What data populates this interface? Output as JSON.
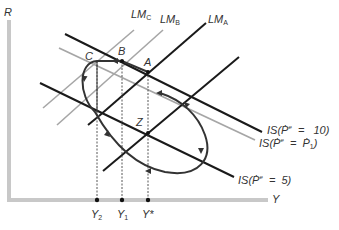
{
  "diagram": {
    "type": "IS-LM dynamic adjustment diagram",
    "axes": {
      "y_label": "R",
      "x_label": "Y",
      "x_ticks": [
        "Y2",
        "Y1",
        "Y*"
      ]
    },
    "curves": {
      "lm_a": "LM_A",
      "lm_b": "LM_B",
      "lm_c": "LM_C",
      "is_10": "IS(Ṗe = 10)",
      "is_p1": "IS(Ṗe = Ṗ1)",
      "is_5": "IS(Ṗe = 5)"
    },
    "points": [
      "A",
      "B",
      "C",
      "Z"
    ],
    "colors": {
      "black_line": "#1a1a1a",
      "gray_line": "#a6a6a6",
      "axis": "#c8c8c8",
      "loop": "#333333"
    }
  },
  "labels": {
    "R": "R",
    "Y": "Y",
    "LM": "LM",
    "A_sub": "A",
    "B_sub": "B",
    "C_sub": "C",
    "pA": "A",
    "pB": "B",
    "pC": "C",
    "pZ": "Z",
    "is10_prefix": "IS(",
    "is10_p": "Ṗ",
    "is10_sup": "e",
    "is10_eq": "=",
    "is10_val": "10)",
    "isp1_prefix": "IS(",
    "isp1_p": "Ṗ",
    "isp1_sup": "e",
    "isp1_eq": "=",
    "isp1_val": "Ṗ",
    "isp1_sub": "1",
    "isp1_close": ")",
    "is5_prefix": "IS(",
    "is5_p": "Ṗ",
    "is5_sup": "e",
    "is5_eq": "=",
    "is5_val": "5)",
    "y2": "Y",
    "y2_sub": "2",
    "y1": "Y",
    "y1_sub": "1",
    "ystar": "Y*"
  }
}
